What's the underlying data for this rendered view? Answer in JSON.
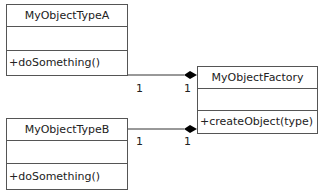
{
  "diagram": {
    "type": "UML class diagram",
    "classes": [
      {
        "id": "typeA",
        "name": "MyObjectTypeA",
        "attributes": [],
        "operations": [
          "+doSomething()"
        ]
      },
      {
        "id": "factory",
        "name": "MyObjectFactory",
        "attributes": [],
        "operations": [
          "+createObject(type)"
        ]
      },
      {
        "id": "typeB",
        "name": "MyObjectTypeB",
        "attributes": [],
        "operations": [
          "+doSomething()"
        ]
      }
    ],
    "relationships": [
      {
        "kind": "composition",
        "from": "MyObjectTypeA",
        "to": "MyObjectFactory",
        "from_multiplicity": "1",
        "to_multiplicity": "1"
      },
      {
        "kind": "composition",
        "from": "MyObjectTypeB",
        "to": "MyObjectFactory",
        "from_multiplicity": "1",
        "to_multiplicity": "1"
      }
    ]
  },
  "colors": {
    "line": "#555555",
    "diamond": "#000000",
    "background": "#ffffff"
  }
}
